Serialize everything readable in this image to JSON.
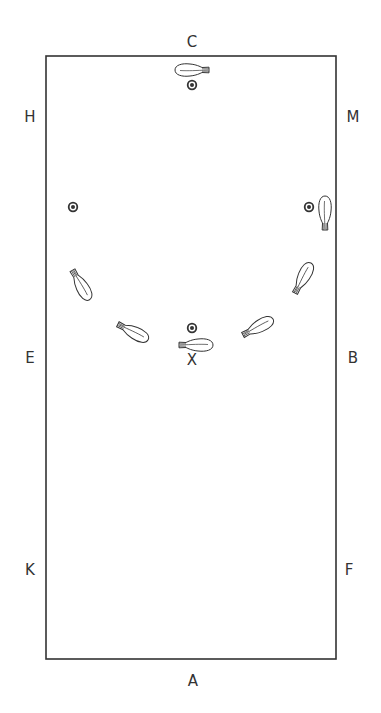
{
  "diagram": {
    "type": "dressage-arena",
    "arena": {
      "x": 46,
      "y": 56,
      "width": 290,
      "height": 603,
      "stroke": "#333333"
    },
    "letters": [
      {
        "label": "C",
        "x": 192,
        "y": 42
      },
      {
        "label": "H",
        "x": 30,
        "y": 117
      },
      {
        "label": "M",
        "x": 353,
        "y": 117
      },
      {
        "label": "E",
        "x": 30,
        "y": 358
      },
      {
        "label": "B",
        "x": 353,
        "y": 358
      },
      {
        "label": "X",
        "x": 192,
        "y": 360
      },
      {
        "label": "K",
        "x": 30,
        "y": 570
      },
      {
        "label": "F",
        "x": 349,
        "y": 570
      },
      {
        "label": "A",
        "x": 193,
        "y": 681
      }
    ],
    "markers": [
      {
        "name": "marker-c",
        "x": 192,
        "y": 85
      },
      {
        "name": "marker-left",
        "x": 73,
        "y": 207
      },
      {
        "name": "marker-right",
        "x": 309,
        "y": 207
      },
      {
        "name": "marker-x",
        "x": 192,
        "y": 328
      }
    ],
    "horses": [
      {
        "x": 192,
        "y": 70,
        "heading": 0
      },
      {
        "x": 325,
        "y": 213,
        "heading": 90
      },
      {
        "x": 303,
        "y": 278,
        "heading": 118
      },
      {
        "x": 258,
        "y": 327,
        "heading": 152
      },
      {
        "x": 196,
        "y": 345,
        "heading": 180
      },
      {
        "x": 133,
        "y": 332,
        "heading": 207
      },
      {
        "x": 81,
        "y": 285,
        "heading": 240
      }
    ],
    "colors": {
      "line": "#333333",
      "fill": "#ffffff"
    }
  }
}
